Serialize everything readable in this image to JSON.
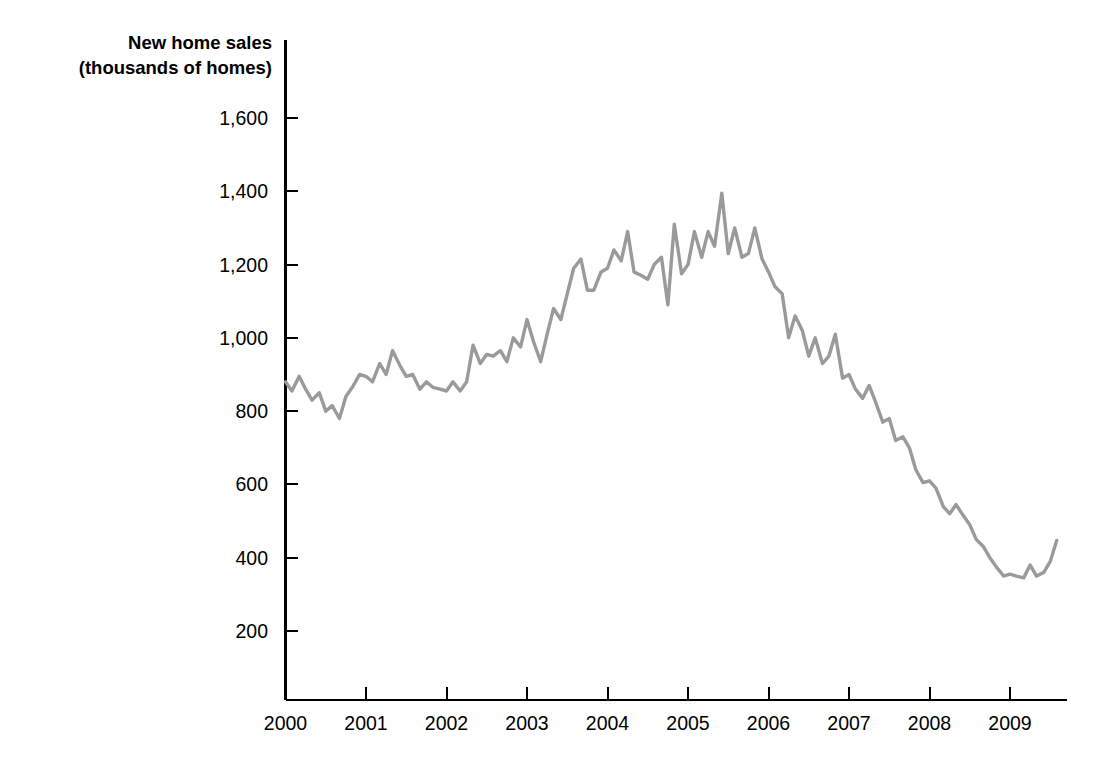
{
  "chart_data": {
    "type": "line",
    "title": "",
    "ylabel_line1": "New home sales",
    "ylabel_line2": "(thousands of homes)",
    "xlabel": "",
    "series_name": "New home sales",
    "series_color": "#9a9a9a",
    "grid": false,
    "legend": "none",
    "xlim": [
      2000.0,
      2009.67
    ],
    "ylim": [
      0,
      1700
    ],
    "y_ticks": [
      200,
      400,
      600,
      800,
      1000,
      1200,
      1400,
      1600
    ],
    "y_tick_labels": [
      "200",
      "400",
      "600",
      "800",
      "1,000",
      "1,200",
      "1,400",
      "1,600"
    ],
    "x_ticks": [
      2000,
      2001,
      2002,
      2003,
      2004,
      2005,
      2006,
      2007,
      2008,
      2009
    ],
    "x_tick_labels": [
      "2000",
      "2001",
      "2002",
      "2003",
      "2004",
      "2005",
      "2006",
      "2007",
      "2008",
      "2009"
    ],
    "x": [
      2000.0,
      2000.08,
      2000.17,
      2000.25,
      2000.33,
      2000.42,
      2000.5,
      2000.58,
      2000.67,
      2000.75,
      2000.83,
      2000.92,
      2001.0,
      2001.08,
      2001.17,
      2001.25,
      2001.33,
      2001.42,
      2001.5,
      2001.58,
      2001.67,
      2001.75,
      2001.83,
      2001.92,
      2002.0,
      2002.08,
      2002.17,
      2002.25,
      2002.33,
      2002.42,
      2002.5,
      2002.58,
      2002.67,
      2002.75,
      2002.83,
      2002.92,
      2003.0,
      2003.08,
      2003.17,
      2003.25,
      2003.33,
      2003.42,
      2003.5,
      2003.58,
      2003.67,
      2003.75,
      2003.83,
      2003.92,
      2004.0,
      2004.08,
      2004.17,
      2004.25,
      2004.33,
      2004.42,
      2004.5,
      2004.58,
      2004.67,
      2004.75,
      2004.83,
      2004.92,
      2005.0,
      2005.08,
      2005.17,
      2005.25,
      2005.33,
      2005.42,
      2005.5,
      2005.58,
      2005.67,
      2005.75,
      2005.83,
      2005.92,
      2006.0,
      2006.08,
      2006.17,
      2006.25,
      2006.33,
      2006.42,
      2006.5,
      2006.58,
      2006.67,
      2006.75,
      2006.83,
      2006.92,
      2007.0,
      2007.08,
      2007.17,
      2007.25,
      2007.33,
      2007.42,
      2007.5,
      2007.58,
      2007.67,
      2007.75,
      2007.83,
      2007.92,
      2008.0,
      2008.08,
      2008.17,
      2008.25,
      2008.33,
      2008.42,
      2008.5,
      2008.58,
      2008.67,
      2008.75,
      2008.83,
      2008.92,
      2009.0,
      2009.08,
      2009.17,
      2009.25,
      2009.33,
      2009.42,
      2009.5,
      2009.58
    ],
    "values": [
      880,
      855,
      895,
      860,
      830,
      850,
      800,
      815,
      780,
      840,
      865,
      900,
      895,
      880,
      930,
      900,
      965,
      925,
      895,
      900,
      860,
      880,
      865,
      860,
      855,
      880,
      855,
      880,
      980,
      930,
      955,
      950,
      965,
      935,
      1000,
      975,
      1050,
      990,
      935,
      1010,
      1080,
      1050,
      1120,
      1190,
      1215,
      1130,
      1130,
      1180,
      1190,
      1240,
      1210,
      1290,
      1180,
      1170,
      1160,
      1200,
      1220,
      1090,
      1310,
      1175,
      1200,
      1290,
      1220,
      1290,
      1250,
      1395,
      1230,
      1300,
      1220,
      1230,
      1300,
      1215,
      1180,
      1140,
      1120,
      1000,
      1060,
      1020,
      950,
      1000,
      930,
      950,
      1010,
      890,
      900,
      860,
      835,
      870,
      825,
      770,
      780,
      720,
      730,
      700,
      640,
      605,
      610,
      590,
      540,
      520,
      545,
      515,
      490,
      450,
      430,
      400,
      375,
      350,
      355,
      350,
      345,
      380,
      350,
      360,
      390,
      447
    ],
    "annotations": []
  }
}
